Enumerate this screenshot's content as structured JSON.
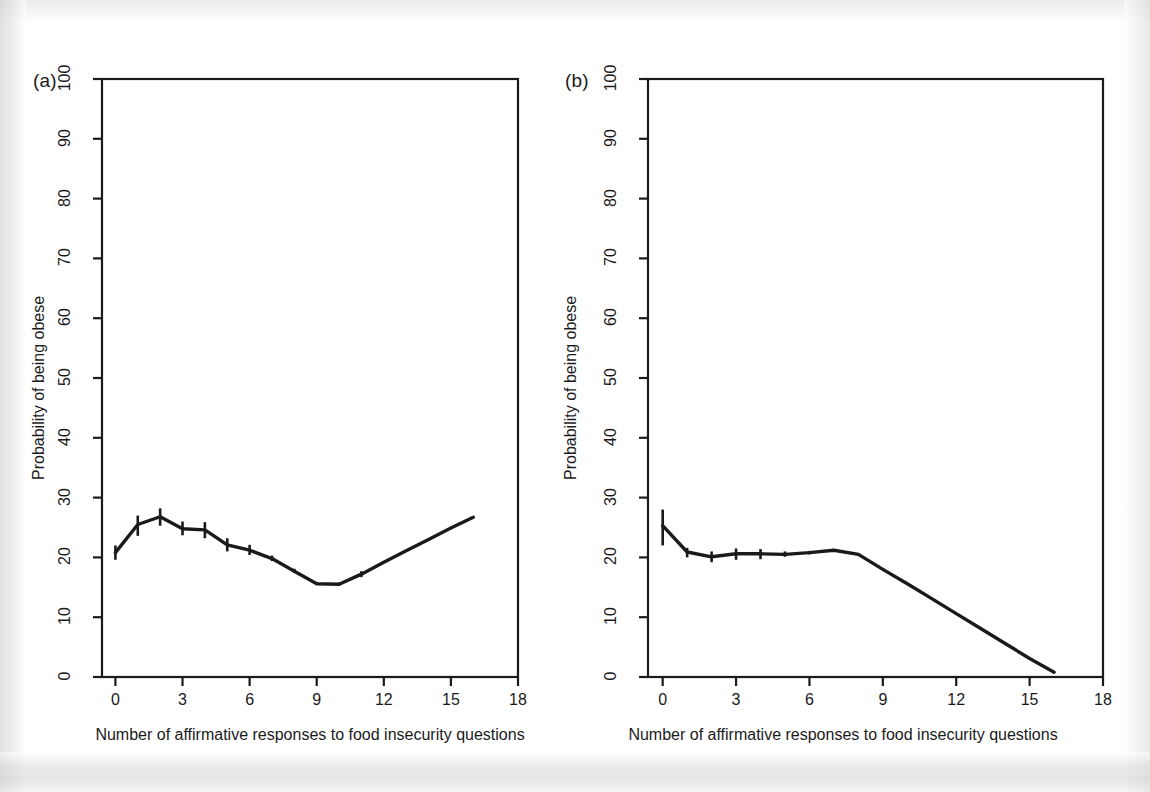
{
  "figure": {
    "background": "#ffffff",
    "ink_color": "#1a1a1a"
  },
  "panels": [
    {
      "tag": "(a)"
    },
    {
      "tag": "(b)"
    }
  ],
  "axes": {
    "xlabel": "Number of affirmative responses to food insecurity questions",
    "ylabel": "Probability of being obese",
    "xticks": [
      "0",
      "3",
      "6",
      "9",
      "12",
      "15",
      "18"
    ],
    "yticks": [
      "0",
      "10",
      "20",
      "30",
      "40",
      "50",
      "60",
      "70",
      "80",
      "90",
      "100"
    ]
  },
  "chart_data": [
    {
      "type": "line",
      "panel": "(a)",
      "title": "(a)",
      "xlabel": "Number of affirmative responses to food insecurity questions",
      "ylabel": "Probability of being obese",
      "xlim": [
        -0.6,
        18
      ],
      "ylim": [
        0,
        100
      ],
      "xticks": [
        0,
        3,
        6,
        9,
        12,
        15,
        18
      ],
      "yticks": [
        0,
        10,
        20,
        30,
        40,
        50,
        60,
        70,
        80,
        90,
        100
      ],
      "grid": false,
      "legend": "none",
      "x": [
        0,
        1,
        2,
        3,
        4,
        5,
        6,
        7,
        8,
        9,
        10,
        11,
        12,
        13,
        14,
        15,
        16
      ],
      "y": [
        20.8,
        25.5,
        26.8,
        24.8,
        24.6,
        22.1,
        21.2,
        19.8,
        17.7,
        15.6,
        15.5,
        17.2,
        19.2,
        21.1,
        23.0,
        24.9,
        26.7
      ],
      "error_bars": {
        "x": [
          0,
          1,
          2,
          3,
          4,
          5,
          6,
          7,
          8,
          9,
          10,
          11
        ],
        "lower": [
          19.6,
          23.6,
          25.3,
          23.7,
          23.2,
          21.0,
          20.4,
          19.4,
          17.4,
          15.4,
          15.3,
          16.7
        ],
        "upper": [
          22.0,
          27.0,
          28.2,
          26.0,
          25.9,
          23.2,
          22.1,
          20.3,
          18.1,
          15.9,
          15.8,
          17.7
        ]
      }
    },
    {
      "type": "line",
      "panel": "(b)",
      "title": "(b)",
      "xlabel": "Number of affirmative responses to food insecurity questions",
      "ylabel": "Probability of being obese",
      "xlim": [
        -0.6,
        18
      ],
      "ylim": [
        0,
        100
      ],
      "xticks": [
        0,
        3,
        6,
        9,
        12,
        15,
        18
      ],
      "yticks": [
        0,
        10,
        20,
        30,
        40,
        50,
        60,
        70,
        80,
        90,
        100
      ],
      "grid": false,
      "legend": "none",
      "x": [
        0,
        1,
        2,
        3,
        4,
        5,
        6,
        7,
        8,
        9,
        10,
        11,
        12,
        13,
        14,
        15,
        16
      ],
      "y": [
        25.3,
        20.9,
        20.1,
        20.6,
        20.6,
        20.5,
        20.8,
        21.2,
        20.5,
        18.0,
        15.6,
        13.1,
        10.6,
        8.1,
        5.6,
        3.1,
        0.8
      ],
      "error_bars": {
        "x": [
          0,
          1,
          2,
          3,
          4,
          5,
          6
        ],
        "lower": [
          22.0,
          20.0,
          19.2,
          19.6,
          19.7,
          20.1,
          20.5
        ],
        "upper": [
          28.0,
          21.6,
          21.0,
          21.5,
          21.4,
          21.0,
          21.1
        ]
      }
    }
  ]
}
